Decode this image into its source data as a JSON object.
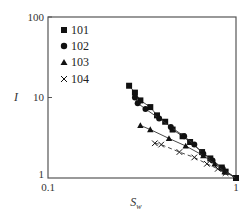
{
  "chart_data": {
    "type": "scatter",
    "title": "",
    "xlabel": "S_w",
    "ylabel": "I",
    "xscale": "log",
    "yscale": "log",
    "xlim": [
      0.1,
      1
    ],
    "ylim": [
      1,
      100
    ],
    "x_ticks": [
      "0.1",
      "1"
    ],
    "y_ticks": [
      "1",
      "10",
      "100"
    ],
    "grid": false,
    "legend_position": "upper left",
    "series": [
      {
        "name": "101",
        "marker": "square",
        "line": "solid",
        "points": [
          [
            0.27,
            14.0
          ],
          [
            0.29,
            11.5
          ],
          [
            0.31,
            9.2
          ],
          [
            0.35,
            7.6
          ],
          [
            0.38,
            6.0
          ],
          [
            0.42,
            5.0
          ],
          [
            0.46,
            4.0
          ],
          [
            0.52,
            3.3
          ],
          [
            0.57,
            2.8
          ],
          [
            0.66,
            2.1
          ],
          [
            0.73,
            1.75
          ],
          [
            0.84,
            1.35
          ],
          [
            0.88,
            1.2
          ],
          [
            1.0,
            1.0
          ]
        ]
      },
      {
        "name": "102",
        "marker": "circle",
        "line": "solid",
        "points": [
          [
            0.29,
            10.0
          ],
          [
            0.3,
            8.5
          ],
          [
            0.33,
            7.2
          ],
          [
            0.39,
            5.5
          ],
          [
            0.45,
            4.3
          ],
          [
            0.53,
            3.3
          ],
          [
            0.6,
            2.6
          ],
          [
            0.67,
            2.0
          ],
          [
            0.75,
            1.65
          ],
          [
            0.85,
            1.3
          ],
          [
            1.0,
            1.0
          ]
        ]
      },
      {
        "name": "103",
        "marker": "triangle",
        "line": "solid",
        "points": [
          [
            0.31,
            4.5
          ],
          [
            0.35,
            4.0
          ],
          [
            0.44,
            3.1
          ],
          [
            0.54,
            2.5
          ],
          [
            0.67,
            1.9
          ],
          [
            0.77,
            1.5
          ],
          [
            0.87,
            1.2
          ],
          [
            1.0,
            1.0
          ]
        ]
      },
      {
        "name": "104",
        "marker": "x",
        "line": "dashed",
        "points": [
          [
            0.37,
            2.7
          ],
          [
            0.4,
            2.6
          ],
          [
            0.5,
            2.1
          ],
          [
            0.6,
            1.8
          ],
          [
            0.7,
            1.5
          ],
          [
            0.8,
            1.3
          ],
          [
            0.88,
            1.15
          ],
          [
            1.0,
            1.0
          ]
        ]
      }
    ]
  },
  "legend": {
    "items": [
      {
        "label": "101",
        "marker": "square"
      },
      {
        "label": "102",
        "marker": "circle"
      },
      {
        "label": "103",
        "marker": "triangle"
      },
      {
        "label": "104",
        "marker": "x"
      }
    ]
  },
  "axes": {
    "y_tick_100": "100",
    "y_tick_10": "10",
    "y_tick_1": "1",
    "x_tick_01": "0.1",
    "x_tick_1": "1",
    "xlabel_main": "S",
    "xlabel_sub": "w",
    "ylabel": "I"
  },
  "colors": {
    "frame": "#555555",
    "marker": "#111111",
    "line": "#333333"
  }
}
